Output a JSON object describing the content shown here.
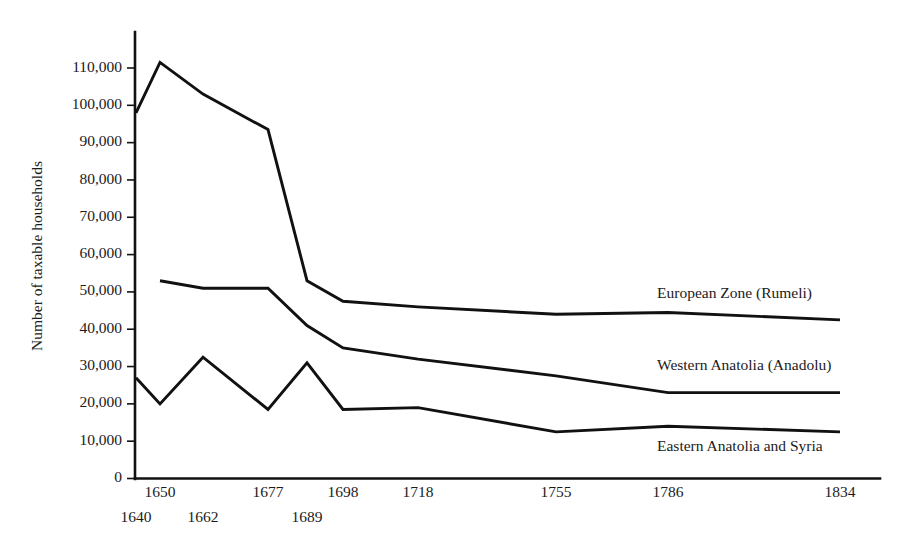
{
  "chart_data": {
    "type": "line",
    "title": "",
    "xlabel": "",
    "ylabel": "Number of taxable households",
    "ylim": [
      0,
      118000
    ],
    "yticks": [
      0,
      10000,
      20000,
      30000,
      40000,
      50000,
      60000,
      70000,
      80000,
      90000,
      100000,
      110000
    ],
    "ytick_labels": [
      "0",
      "10,000",
      "20,000",
      "30,000",
      "40,000",
      "50,000",
      "60,000",
      "70,000",
      "80,000",
      "90,000",
      "100,000",
      "110,000"
    ],
    "categories": [
      "1640",
      "1650",
      "1662",
      "1677",
      "1689",
      "1698",
      "1718",
      "1755",
      "1786",
      "1834"
    ],
    "x": [
      1640,
      1650,
      1662,
      1677,
      1689,
      1698,
      1718,
      1755,
      1786,
      1834
    ],
    "grid": false,
    "legend_position": "inline-right",
    "series": [
      {
        "name": "European Zone (Rumeli)",
        "values": [
          98000,
          111500,
          103000,
          93500,
          53000,
          47500,
          46000,
          44000,
          44500,
          42500
        ]
      },
      {
        "name": "Western Anatolia (Anadolu)",
        "values": [
          null,
          53000,
          51000,
          51000,
          41000,
          35000,
          32000,
          27500,
          23000,
          23000
        ]
      },
      {
        "name": "Eastern Anatolia and Syria",
        "values": [
          27000,
          20000,
          32500,
          18500,
          31000,
          18500,
          19000,
          12500,
          14000,
          12500
        ]
      }
    ],
    "series_end_labels": [
      {
        "text": "European Zone (Rumeli)",
        "anchor_value": 48500
      },
      {
        "text": "Western Anatolia (Anadolu)",
        "anchor_value": 29000
      },
      {
        "text": "Eastern Anatolia and Syria",
        "anchor_value": 7500
      }
    ]
  },
  "axis": {
    "y_title": "Number of taxable households",
    "y_tick_labels": [
      "110,000",
      "100,000",
      "90,000",
      "80,000",
      "70,000",
      "60,000",
      "50,000",
      "40,000",
      "30,000",
      "20,000",
      "10,000",
      "0"
    ],
    "x_tick_labels_upper": [
      "1650",
      "1677",
      "1698",
      "1718",
      "1755",
      "1786",
      "1834"
    ],
    "x_tick_labels_lower": [
      "1640",
      "1662",
      "1689"
    ]
  },
  "colors": {
    "ink": "#111111",
    "background": "#ffffff"
  }
}
